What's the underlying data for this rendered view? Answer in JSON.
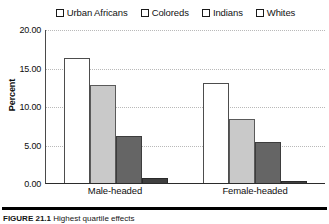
{
  "chart_data": {
    "type": "bar",
    "title": "",
    "xlabel": "",
    "ylabel": "Percent",
    "categories": [
      "Male-headed",
      "Female-headed"
    ],
    "series": [
      {
        "name": "Urban Africans",
        "values": [
          16.3,
          13.0
        ],
        "color": "#ffffff"
      },
      {
        "name": "Coloreds",
        "values": [
          12.7,
          8.3
        ],
        "color": "#c9c9c9"
      },
      {
        "name": "Indians",
        "values": [
          6.1,
          5.3
        ],
        "color": "#656565"
      },
      {
        "name": "Whites",
        "values": [
          0.7,
          0.3
        ],
        "color": "#3f3f3f"
      }
    ],
    "ylim": [
      0,
      20
    ],
    "y_ticks": [
      0,
      5,
      10,
      15,
      20
    ],
    "y_tick_labels": [
      "0.00",
      "5.00",
      "10.00",
      "15.00",
      "20.00"
    ],
    "grid": true,
    "legend_position": "top"
  },
  "legend": {
    "items": [
      {
        "label": "Urban Africans"
      },
      {
        "label": "Coloreds"
      },
      {
        "label": "Indians"
      },
      {
        "label": "Whites"
      }
    ]
  },
  "caption": {
    "label": "FIGURE 21.1",
    "text": "Highest quartile effects"
  }
}
